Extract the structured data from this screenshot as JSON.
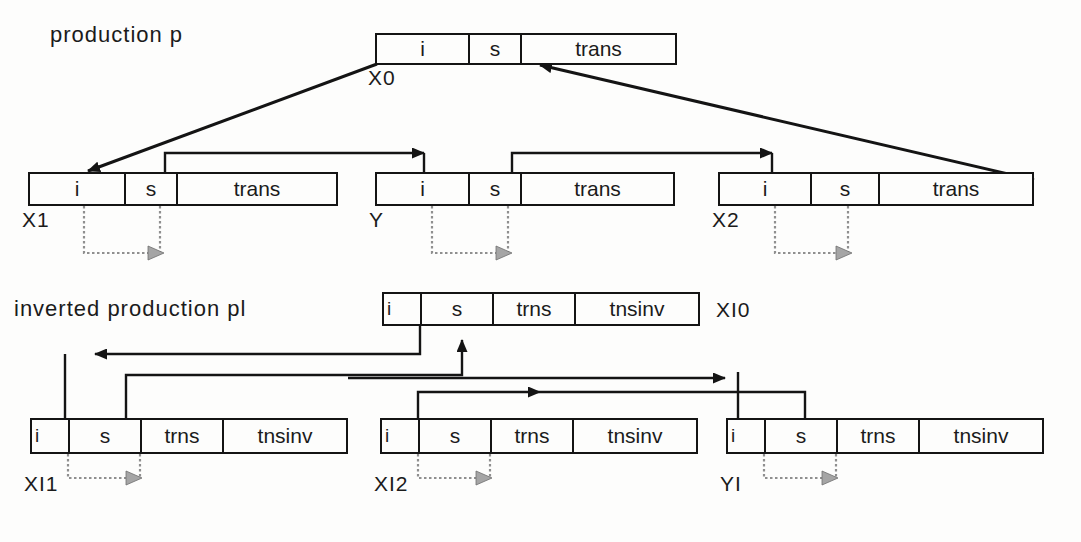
{
  "diagram": {
    "title_upper": "production  p",
    "title_lower": "inverted  production  pl",
    "upper": {
      "parent": {
        "id": "X0",
        "label": "X0",
        "cells": [
          "i",
          "s",
          "trans"
        ],
        "box": {
          "x": 375,
          "y": 33,
          "w": 302,
          "h": 32
        },
        "dividers": [
          93,
          145
        ],
        "label_pos": {
          "x": 370,
          "y": 66
        }
      },
      "children": [
        {
          "id": "X1",
          "label": "X1",
          "cells": [
            "i",
            "s",
            "trans"
          ],
          "box": {
            "x": 28,
            "y": 172,
            "w": 310,
            "h": 34
          },
          "dividers": [
            96,
            148
          ],
          "label_pos": {
            "x": 24,
            "y": 208
          },
          "dotted": {
            "x1": 84,
            "x2": 160,
            "ytop": 206,
            "ybot": 253
          }
        },
        {
          "id": "Y",
          "label": "Y",
          "cells": [
            "i",
            "s",
            "trans"
          ],
          "box": {
            "x": 375,
            "y": 172,
            "w": 300,
            "h": 34
          },
          "dividers": [
            93,
            145
          ],
          "label_pos": {
            "x": 370,
            "y": 208
          },
          "dotted": {
            "x1": 432,
            "x2": 508,
            "ytop": 206,
            "ybot": 253
          }
        },
        {
          "id": "X2",
          "label": "X2",
          "cells": [
            "i",
            "s",
            "trans"
          ],
          "box": {
            "x": 718,
            "y": 172,
            "w": 316,
            "h": 34
          },
          "dividers": [
            92,
            160
          ],
          "label_pos": {
            "x": 713,
            "y": 208
          },
          "dotted": {
            "x1": 775,
            "x2": 848,
            "ytop": 206,
            "ybot": 253
          }
        }
      ]
    },
    "lower": {
      "parent": {
        "id": "XI0",
        "label": "XI0",
        "cells": [
          "i",
          "s",
          "trns",
          "tnsinv"
        ],
        "box": {
          "x": 382,
          "y": 292,
          "w": 318,
          "h": 34
        },
        "dividers": [
          38,
          110,
          192
        ],
        "label_pos": {
          "x": 718,
          "y": 316
        }
      },
      "children": [
        {
          "id": "XI1",
          "label": "XI1",
          "cells": [
            "i",
            "s",
            "trns",
            "tnsinv"
          ],
          "box": {
            "x": 30,
            "y": 418,
            "w": 318,
            "h": 36
          },
          "dividers": [
            38,
            110,
            192
          ],
          "label_pos": {
            "x": 26,
            "y": 456
          },
          "dotted": {
            "x1": 68,
            "x2": 140,
            "ytop": 454,
            "ybot": 478
          }
        },
        {
          "id": "XI2",
          "label": "XI2",
          "cells": [
            "i",
            "s",
            "trns",
            "tnsinv"
          ],
          "box": {
            "x": 380,
            "y": 418,
            "w": 318,
            "h": 36
          },
          "dividers": [
            38,
            110,
            192
          ],
          "label_pos": {
            "x": 376,
            "y": 456
          },
          "dotted": {
            "x1": 418,
            "x2": 490,
            "ytop": 454,
            "ybot": 478
          }
        },
        {
          "id": "YI",
          "label": "YI",
          "cells": [
            "i",
            "s",
            "trns",
            "tnsinv"
          ],
          "box": {
            "x": 726,
            "y": 418,
            "w": 318,
            "h": 36
          },
          "dividers": [
            38,
            110,
            192
          ],
          "label_pos": {
            "x": 722,
            "y": 456
          },
          "dotted": {
            "x1": 764,
            "x2": 836,
            "ytop": 454,
            "ybot": 478
          }
        }
      ]
    }
  }
}
